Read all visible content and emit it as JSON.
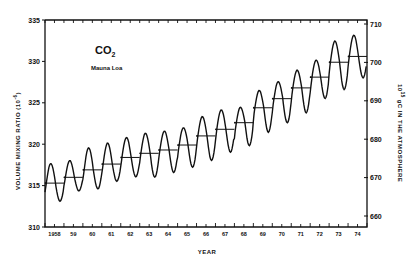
{
  "chart_data": {
    "type": "line",
    "title": "CO2",
    "title_sub": "2",
    "subtitle": "Mauna Loa",
    "xlabel": "YEAR",
    "ylabel": "VOLUME MIXING RATIO (10^-6)",
    "ylabel_right": "10^15 gC IN THE ATMOSPHERE",
    "ylim": [
      310,
      335
    ],
    "ylim_right": [
      658,
      712
    ],
    "yticks": [
      310,
      315,
      320,
      325,
      330,
      335
    ],
    "yticks_right": [
      660,
      670,
      680,
      690,
      700,
      710
    ],
    "xticks": [
      "1958",
      "59",
      "60",
      "61",
      "62",
      "63",
      "64",
      "65",
      "66",
      "67",
      "68",
      "69",
      "70",
      "71",
      "72",
      "73",
      "74"
    ],
    "grid": false,
    "legend": null,
    "series": [
      {
        "name": "Annual mean (horizontal bars)",
        "years": [
          1958,
          1959,
          1960,
          1961,
          1962,
          1963,
          1964,
          1965,
          1966,
          1967,
          1968,
          1969,
          1970,
          1971,
          1972,
          1973,
          1974
        ],
        "values": [
          315.3,
          316.0,
          316.9,
          317.6,
          318.4,
          318.9,
          319.3,
          319.9,
          321.0,
          321.8,
          322.6,
          324.4,
          325.5,
          326.8,
          328.1,
          329.9,
          330.6
        ]
      },
      {
        "name": "Monthly (seasonal cycle)",
        "seasonal_amplitude": [
          2.4,
          2.2,
          2.9,
          2.8,
          2.9,
          3.0,
          3.0,
          3.0,
          3.1,
          3.1,
          3.1,
          3.2,
          3.2,
          3.2,
          3.3,
          3.4,
          3.4
        ],
        "peaks": [
          317.8,
          318.2,
          319.7,
          320.3,
          320.9,
          321.4,
          321.7,
          322.2,
          323.5,
          324.3,
          324.8,
          326.7,
          327.8,
          329.2,
          330.5,
          332.6,
          333.3
        ],
        "troughs": [
          312.9,
          314.1,
          314.4,
          315.3,
          315.9,
          315.9,
          316.4,
          316.9,
          317.8,
          318.8,
          319.3,
          321.1,
          322.2,
          323.4,
          325.0,
          326.4,
          327.8
        ]
      }
    ]
  },
  "labels": {
    "title_main": "CO",
    "title_sub": "2",
    "subtitle": "Mauna Loa",
    "xlabel": "YEAR",
    "ylabel": "VOLUME MIXING RATIO (10",
    "ylabel_exp": "-6",
    "ylabel_end": ")",
    "ylabel_right_pre": "10",
    "ylabel_right_exp": "15",
    "ylabel_right_post": "gC  IN THE ATMOSPHERE"
  },
  "colors": {
    "ink": "#111111",
    "background": "#ffffff"
  }
}
